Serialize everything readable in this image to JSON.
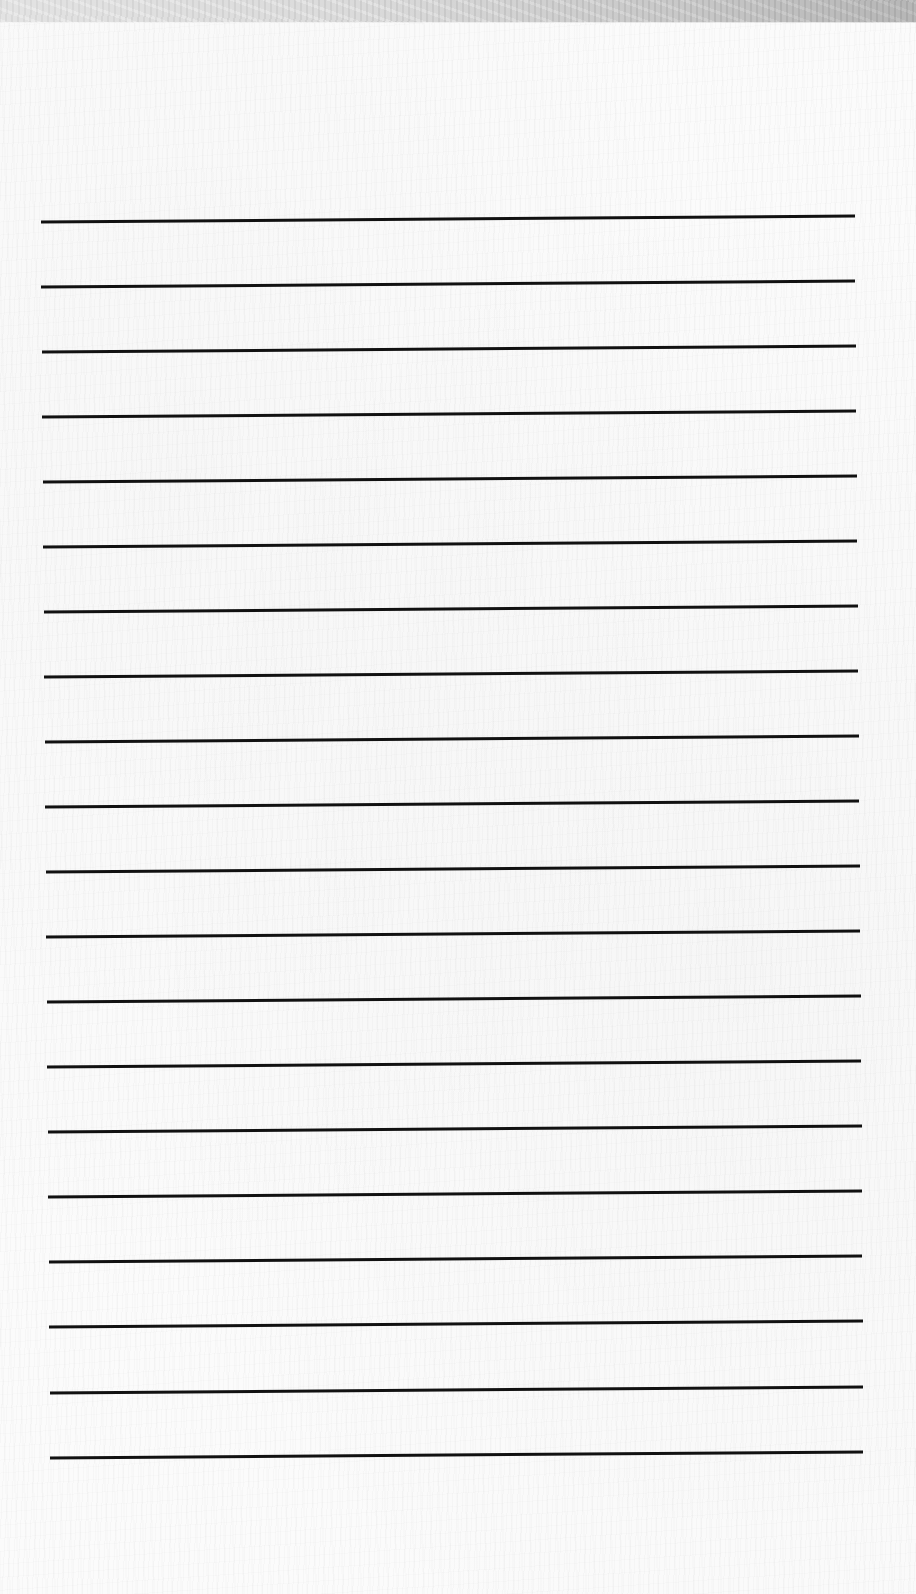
{
  "page": {
    "type": "ruled-paper",
    "background_color": "#fbfbfb",
    "top_strip_color": "#d4d4d4",
    "line_color": "#111111",
    "line_width": 3,
    "line_count": 20,
    "lines": [
      {
        "x1": 41,
        "y1": 222,
        "x2": 855,
        "y2": 216
      },
      {
        "x1": 41,
        "y1": 287,
        "x2": 855,
        "y2": 281
      },
      {
        "x1": 42,
        "y1": 352,
        "x2": 856,
        "y2": 346
      },
      {
        "x1": 42,
        "y1": 417,
        "x2": 856,
        "y2": 411
      },
      {
        "x1": 43,
        "y1": 482,
        "x2": 857,
        "y2": 476
      },
      {
        "x1": 43,
        "y1": 547,
        "x2": 857,
        "y2": 541
      },
      {
        "x1": 44,
        "y1": 612,
        "x2": 858,
        "y2": 606
      },
      {
        "x1": 44,
        "y1": 677,
        "x2": 858,
        "y2": 671
      },
      {
        "x1": 45,
        "y1": 742,
        "x2": 859,
        "y2": 736
      },
      {
        "x1": 45,
        "y1": 807,
        "x2": 859,
        "y2": 801
      },
      {
        "x1": 46,
        "y1": 872,
        "x2": 860,
        "y2": 866
      },
      {
        "x1": 46,
        "y1": 937,
        "x2": 860,
        "y2": 931
      },
      {
        "x1": 47,
        "y1": 1002,
        "x2": 861,
        "y2": 996
      },
      {
        "x1": 47,
        "y1": 1067,
        "x2": 861,
        "y2": 1061
      },
      {
        "x1": 48,
        "y1": 1132,
        "x2": 862,
        "y2": 1126
      },
      {
        "x1": 48,
        "y1": 1197,
        "x2": 862,
        "y2": 1191
      },
      {
        "x1": 49,
        "y1": 1262,
        "x2": 862,
        "y2": 1256
      },
      {
        "x1": 49,
        "y1": 1327,
        "x2": 863,
        "y2": 1321
      },
      {
        "x1": 50,
        "y1": 1393,
        "x2": 863,
        "y2": 1387
      },
      {
        "x1": 50,
        "y1": 1458,
        "x2": 863,
        "y2": 1452
      }
    ]
  }
}
